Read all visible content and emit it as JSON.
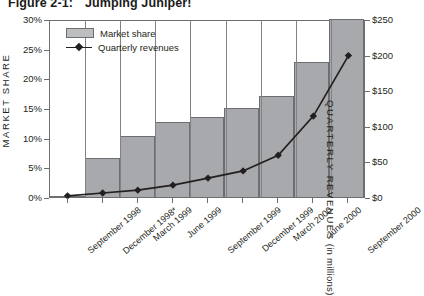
{
  "figure": {
    "number": "Figure 2-1:",
    "title": "Jumping Juniper!"
  },
  "axes": {
    "left_title": "MARKET SHARE",
    "right_title": "QUARTERLY REVENUES",
    "right_title_unit": "(in millions)",
    "left_ticks": [
      "30%",
      "25%",
      "20%",
      "15%",
      "10%",
      "5%",
      "0%"
    ],
    "right_ticks": [
      "$250",
      "$200",
      "$150",
      "$100",
      "$50",
      "$0"
    ]
  },
  "legend": {
    "items": [
      {
        "label": "Market share",
        "marker": "bar-swatch",
        "color": "#bcbec0"
      },
      {
        "label": "Quarterly revenues",
        "marker": "line-diamond",
        "color": "#231f20"
      }
    ]
  },
  "colors": {
    "bar_fill": "#a7a9ac",
    "bar_stroke": "#6d6e71",
    "line": "#231f20",
    "axis": "#6d6e71",
    "text": "#231f20"
  },
  "chart_data": {
    "type": "bar",
    "title": "Jumping Juniper!",
    "xlabel": "",
    "ylabel": "MARKET SHARE",
    "y2label": "QUARTERLY REVENUES (in millions)",
    "categories": [
      "September 1998",
      "December 1998*",
      "March 1999",
      "June 1999",
      "September 1999",
      "December 1999",
      "March 2000",
      "June 2000",
      "September 2000"
    ],
    "series": [
      {
        "name": "Market share",
        "type": "bar",
        "axis": "left",
        "unit": "percent",
        "values": [
          0.2,
          6.5,
          10.2,
          12.7,
          13.5,
          15.0,
          17.0,
          22.8,
          30.0
        ]
      },
      {
        "name": "Quarterly revenues",
        "type": "line",
        "axis": "right",
        "unit": "millions USD",
        "values": [
          3,
          7,
          11,
          18,
          28,
          38,
          60,
          115,
          200
        ]
      }
    ],
    "ylim": [
      0,
      30
    ],
    "y2lim": [
      0,
      250
    ],
    "ytick_values": [
      0,
      5,
      10,
      15,
      20,
      25,
      30
    ],
    "y2tick_values": [
      0,
      50,
      100,
      150,
      200,
      250
    ],
    "grid": false,
    "legend_position": "upper-left-inside",
    "footnote_marker": "*"
  }
}
